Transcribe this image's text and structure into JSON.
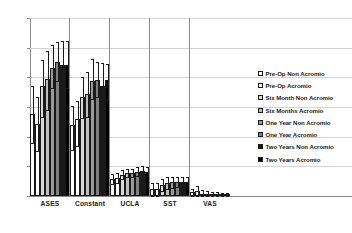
{
  "chart_data": {
    "type": "bar",
    "title": "",
    "subtitle": "",
    "xlabel": "",
    "ylabel": "",
    "ylim": [
      0,
      120
    ],
    "ytick_values": [
      0,
      20,
      40,
      60,
      80,
      100,
      120
    ],
    "ytick_labels": [
      "0",
      "20",
      "40",
      "60",
      "80",
      "100",
      "120"
    ],
    "grid": true,
    "legend_position": "right",
    "categories": [
      "ASES",
      "Constant",
      "UCLA",
      "SST",
      "VAS"
    ],
    "series": [
      {
        "name": "Pre-Op Non Acromio",
        "color": "#ffffff",
        "values": [
          55,
          48,
          11.5,
          4.5,
          2.5
        ],
        "err_low": [
          19,
          17,
          3.5,
          4.5,
          2.5
        ],
        "err_high": [
          19,
          13,
          3.5,
          4.5,
          2.5
        ]
      },
      {
        "name": "Pre-Op Acromio",
        "color": "#ffffff",
        "values": [
          48.5,
          52,
          12,
          5,
          3.5
        ],
        "err_low": [
          18,
          18,
          3.5,
          5,
          3.5
        ],
        "err_high": [
          18,
          12,
          3.5,
          4,
          3.0
        ]
      },
      {
        "name": "Six Month Non Acromio",
        "color": "#d9d9d9",
        "values": [
          74,
          66.5,
          14.5,
          7.5,
          1.5
        ],
        "err_low": [
          21,
          14,
          3,
          4,
          1.5
        ],
        "err_high": [
          18,
          14,
          3,
          4,
          2.5
        ]
      },
      {
        "name": "Six Months Acromio",
        "color": "#bfbfbf",
        "values": [
          79,
          68.5,
          15.5,
          8.5,
          1.2
        ],
        "err_low": [
          21,
          15,
          3,
          4,
          1.2
        ],
        "err_high": [
          19,
          15,
          3,
          4,
          2.0
        ]
      },
      {
        "name": "One Year Non Acromio",
        "color": "#9a9a9a",
        "values": [
          86.5,
          77.5,
          15.5,
          9.5,
          1.0
        ],
        "err_low": [
          14,
          12,
          3,
          4,
          1.0
        ],
        "err_high": [
          15,
          15,
          3,
          3,
          1.8
        ]
      },
      {
        "name": "One Year Acromio",
        "color": "#808080",
        "values": [
          90.5,
          78.5,
          16.5,
          9.5,
          0.8
        ],
        "err_low": [
          13,
          12,
          3,
          3.5,
          0.8
        ],
        "err_high": [
          13,
          12,
          3,
          3,
          1.6
        ]
      },
      {
        "name": "Two Years Non Acromio",
        "color": "#1a1a1a",
        "values": [
          88.5,
          74.5,
          17,
          9.5,
          0.6
        ],
        "err_low": [
          17,
          12,
          3,
          3.5,
          0.6
        ],
        "err_high": [
          16,
          15,
          3,
          3,
          1.4
        ]
      },
      {
        "name": "Two Years Acromio",
        "color": "#000000",
        "values": [
          88.5,
          78,
          16.5,
          9.5,
          0.5
        ],
        "err_low": [
          16,
          13,
          3,
          3.5,
          0.5
        ],
        "err_high": [
          16,
          11,
          3,
          3,
          1.2
        ]
      }
    ]
  },
  "legend": {
    "items": [
      {
        "label": "Pre-Op Non Acromio"
      },
      {
        "label": "Pre-Op Acromio"
      },
      {
        "label": "Six Month Non Acromio"
      },
      {
        "label": "Six Months Acromio"
      },
      {
        "label": "One Year Non Acromio"
      },
      {
        "label": "One Year Acromio"
      },
      {
        "label": "Two Years Non Acromio"
      },
      {
        "label": "Two Years Acromio"
      }
    ]
  }
}
